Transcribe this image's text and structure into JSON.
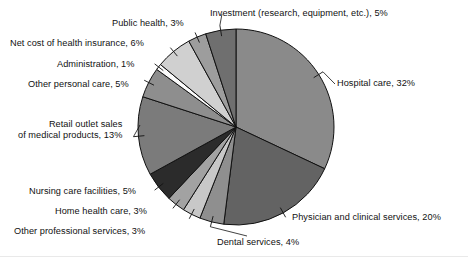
{
  "chart_data": {
    "type": "pie",
    "title": "",
    "subtitle": "",
    "xlabel": "",
    "ylabel": "",
    "legend_position": "labels-with-leader-lines",
    "grid": false,
    "units": "percent",
    "total": 100,
    "start_angle_deg": 0,
    "direction": "clockwise",
    "categories": [
      "Hospital care",
      "Physician and clinical services",
      "Dental services",
      "Other professional services",
      "Home health care",
      "Nursing care facilities",
      "Retail outlet sales of medical products",
      "Other personal care",
      "Administration",
      "Net cost of health insurance",
      "Public health",
      "Investment (research, equipment, etc.)"
    ],
    "values": [
      32,
      20,
      4,
      3,
      3,
      5,
      13,
      5,
      1,
      6,
      3,
      5
    ],
    "colors": [
      "#8a8a8a",
      "#636363",
      "#8f8f8f",
      "#c8c8c8",
      "#a2a2a2",
      "#2b2b2b",
      "#7b7b7b",
      "#8e8e8e",
      "#fbfbfb",
      "#d0d0d0",
      "#9d9d9d",
      "#6f6f6f"
    ],
    "slices": [
      {
        "label": "Hospital care",
        "value": 32,
        "value_text": "32%",
        "color": "#8a8a8a"
      },
      {
        "label": "Physician and clinical services",
        "value": 20,
        "value_text": "20%",
        "color": "#636363"
      },
      {
        "label": "Dental services",
        "value": 4,
        "value_text": "4%",
        "color": "#8f8f8f"
      },
      {
        "label": "Other professional services",
        "value": 3,
        "value_text": "3%",
        "color": "#c8c8c8"
      },
      {
        "label": "Home health care",
        "value": 3,
        "value_text": "3%",
        "color": "#a2a2a2"
      },
      {
        "label": "Nursing care facilities",
        "value": 5,
        "value_text": "5%",
        "color": "#2b2b2b"
      },
      {
        "label": "Retail outlet sales of medical products",
        "value": 13,
        "value_text": "13%",
        "color": "#7b7b7b"
      },
      {
        "label": "Other personal care",
        "value": 5,
        "value_text": "5%",
        "color": "#8e8e8e"
      },
      {
        "label": "Administration",
        "value": 1,
        "value_text": "1%",
        "color": "#fbfbfb"
      },
      {
        "label": "Net cost of health insurance",
        "value": 6,
        "value_text": "6%",
        "color": "#d0d0d0"
      },
      {
        "label": "Public health",
        "value": 3,
        "value_text": "3%",
        "color": "#9d9d9d"
      },
      {
        "label": "Investment (research, equipment, etc.)",
        "value": 5,
        "value_text": "5%",
        "color": "#6f6f6f"
      }
    ]
  },
  "labels": {
    "investment": "Investment (research, equipment, etc.), 5%",
    "public_health": "Public health, 3%",
    "net_cost": "Net cost of health insurance, 6%",
    "administration": "Administration, 1%",
    "other_personal_care": "Other personal care, 5%",
    "retail_outlet": "Retail outlet sales\nof medical products, 13%",
    "nursing_care": "Nursing care facilities, 5%",
    "home_health": "Home health care, 3%",
    "other_professional": "Other professional services, 3%",
    "dental": "Dental services, 4%",
    "physician": "Physician and clinical services, 20%",
    "hospital": "Hospital care, 32%"
  },
  "style": {
    "background": "#ffffff",
    "outline": "#111111",
    "text": "#111111"
  }
}
